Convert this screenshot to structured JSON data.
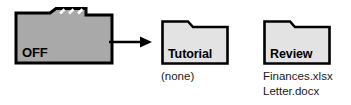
{
  "diagram": {
    "background_color": "#ffffff",
    "source": {
      "label": "OFF",
      "fill_color": "#a9a9a9",
      "stroke_color": "#000000",
      "tab_style": "multi-tab",
      "tab_divider_count": 3,
      "icon_name": "folder-icon"
    },
    "arrow": {
      "direction": "right",
      "color": "#000000",
      "icon_name": "arrow-right-icon"
    },
    "targets": [
      {
        "label": "Tutorial",
        "fill_color": "#e3e3e3",
        "stroke_color": "#000000",
        "icon_name": "folder-icon",
        "contents": [
          "(none)"
        ]
      },
      {
        "label": "Review",
        "fill_color": "#e3e3e3",
        "stroke_color": "#000000",
        "icon_name": "folder-icon",
        "contents": [
          "Finances.xlsx",
          "Letter.docx"
        ]
      }
    ]
  }
}
